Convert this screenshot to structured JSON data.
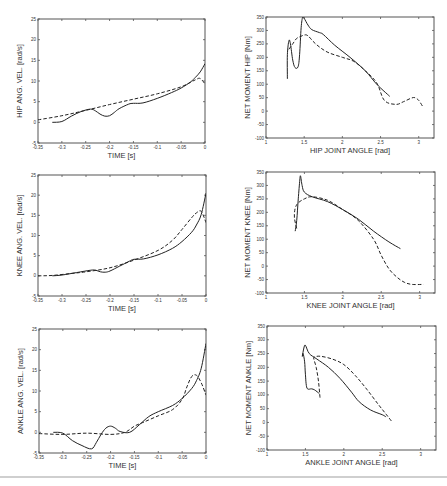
{
  "figure": {
    "colors": {
      "line": "#222222",
      "frame": "#555555",
      "text": "#333333"
    }
  },
  "chart_data": [
    {
      "id": "hip-vel",
      "type": "line",
      "title": "",
      "xlabel": "TIME  [s]",
      "ylabel": "HIP ANG. VEL.  [rad/s]",
      "xlim": [
        -0.35,
        0
      ],
      "ylim": [
        -5,
        25
      ],
      "xticks": [
        -0.35,
        -0.3,
        -0.25,
        -0.2,
        -0.15,
        -0.1,
        -0.05,
        0
      ],
      "xticklabels": [
        "-0.35",
        "-0.3",
        "-0.25",
        "-0.2",
        "-0.15",
        "-0.1",
        "-0.05",
        "0"
      ],
      "yticks": [
        -5,
        0,
        5,
        10,
        15,
        20,
        25
      ],
      "yticklabels": [
        "-5",
        "0",
        "5",
        "10",
        "15",
        "20",
        "25"
      ],
      "frame": {
        "x": 38,
        "y": 19,
        "w": 167,
        "h": 124
      },
      "series": [
        {
          "name": "measured",
          "style": "solid",
          "x": [
            -0.32,
            -0.3,
            -0.28,
            -0.26,
            -0.24,
            -0.23,
            -0.22,
            -0.21,
            -0.2,
            -0.19,
            -0.18,
            -0.16,
            -0.15,
            -0.13,
            -0.1,
            -0.07,
            -0.05,
            -0.03,
            -0.02,
            -0.01,
            0
          ],
          "y": [
            0,
            0.2,
            1.5,
            2.6,
            3.2,
            2.8,
            2.0,
            1.5,
            1.6,
            2.4,
            3.3,
            4.4,
            4.6,
            4.7,
            5.8,
            7.2,
            8.3,
            9.8,
            10.9,
            12.2,
            14.2
          ]
        },
        {
          "name": "model",
          "style": "dashed",
          "x": [
            -0.35,
            -0.3,
            -0.25,
            -0.2,
            -0.15,
            -0.1,
            -0.05,
            -0.02,
            -0.01,
            0
          ],
          "y": [
            0.6,
            1.6,
            2.9,
            4.3,
            5.6,
            6.9,
            8.6,
            10.3,
            10.6,
            9.3
          ]
        }
      ]
    },
    {
      "id": "hip-moment",
      "type": "line",
      "title": "",
      "xlabel": "HIP JOINT ANGLE  [rad]",
      "ylabel": "NET MOMENT HIP  [Nm]",
      "xlim": [
        1,
        3.2
      ],
      "ylim": [
        -100,
        350
      ],
      "xticks": [
        1,
        1.5,
        2,
        2.5,
        3
      ],
      "xticklabels": [
        "1",
        "1.5",
        "2",
        "2.5",
        "3"
      ],
      "yticks": [
        -100,
        -50,
        0,
        50,
        100,
        150,
        200,
        250,
        300,
        350
      ],
      "yticklabels": [
        "-100",
        "-50",
        "0",
        "50",
        "100",
        "150",
        "200",
        "250",
        "300",
        "350"
      ],
      "frame": {
        "x": 266,
        "y": 17,
        "w": 168,
        "h": 121
      },
      "series": [
        {
          "name": "measured",
          "style": "solid",
          "x": [
            1.28,
            1.28,
            1.3,
            1.32,
            1.35,
            1.38,
            1.42,
            1.44,
            1.46,
            1.48,
            1.5,
            1.55,
            1.6,
            1.7,
            1.75,
            1.9,
            2.1,
            2.3,
            2.45,
            2.62
          ],
          "y": [
            120,
            210,
            262,
            250,
            190,
            162,
            165,
            210,
            310,
            350,
            345,
            320,
            303,
            292,
            285,
            245,
            200,
            150,
            100,
            55
          ]
        },
        {
          "name": "model",
          "style": "dashed",
          "x": [
            1.3,
            1.35,
            1.4,
            1.45,
            1.5,
            1.55,
            1.65,
            1.8,
            2.0,
            2.15,
            2.3,
            2.45,
            2.55,
            2.7,
            2.8,
            2.9,
            2.95,
            3.0,
            3.05
          ],
          "y": [
            230,
            250,
            270,
            277,
            283,
            280,
            250,
            220,
            200,
            185,
            150,
            105,
            40,
            25,
            35,
            48,
            50,
            40,
            18
          ]
        }
      ]
    },
    {
      "id": "knee-vel",
      "type": "line",
      "title": "",
      "xlabel": "TIME  [s]",
      "ylabel": "KNEE ANG. VEL.  [rad/s]",
      "xlim": [
        -0.35,
        0
      ],
      "ylim": [
        -5,
        25
      ],
      "xticks": [
        -0.35,
        -0.3,
        -0.25,
        -0.2,
        -0.15,
        -0.1,
        -0.05,
        0
      ],
      "xticklabels": [
        "-0.35",
        "-0.3",
        "-0.25",
        "-0.2",
        "-0.15",
        "-0.1",
        "-0.05",
        "0"
      ],
      "yticks": [
        -5,
        0,
        5,
        10,
        15,
        20,
        25
      ],
      "yticklabels": [
        "-5",
        "0",
        "5",
        "10",
        "15",
        "20",
        "25"
      ],
      "frame": {
        "x": 38,
        "y": 175,
        "w": 168,
        "h": 121
      },
      "series": [
        {
          "name": "measured",
          "style": "solid",
          "x": [
            -0.32,
            -0.3,
            -0.27,
            -0.24,
            -0.23,
            -0.22,
            -0.21,
            -0.2,
            -0.18,
            -0.16,
            -0.15,
            -0.13,
            -0.1,
            -0.07,
            -0.05,
            -0.03,
            -0.02,
            -0.01,
            0
          ],
          "y": [
            0,
            0.2,
            0.8,
            1.4,
            1.4,
            1.0,
            0.9,
            1.2,
            2.4,
            3.6,
            4.1,
            4.2,
            5.2,
            6.8,
            8.5,
            10.8,
            12.6,
            15.2,
            20.5
          ]
        },
        {
          "name": "model",
          "style": "dashed",
          "x": [
            -0.35,
            -0.32,
            -0.28,
            -0.25,
            -0.2,
            -0.15,
            -0.1,
            -0.07,
            -0.05,
            -0.03,
            -0.02,
            -0.01,
            0
          ],
          "y": [
            0,
            0.1,
            0.6,
            1.0,
            2.0,
            3.9,
            6.3,
            8.8,
            11.5,
            14.4,
            15.6,
            16.0,
            13.2
          ]
        }
      ]
    },
    {
      "id": "knee-moment",
      "type": "line",
      "title": "",
      "xlabel": "KNEE JOINT ANGLE  [rad]",
      "ylabel": "NET MOMENT KNEE  [Nm]",
      "xlim": [
        1,
        3.2
      ],
      "ylim": [
        -100,
        350
      ],
      "xticks": [
        1,
        1.5,
        2,
        2.5,
        3
      ],
      "xticklabels": [
        "1",
        "1.5",
        "2",
        "2.5",
        "3"
      ],
      "yticks": [
        -100,
        -50,
        0,
        50,
        100,
        150,
        200,
        250,
        300,
        350
      ],
      "yticklabels": [
        "-100",
        "-50",
        "0",
        "50",
        "100",
        "150",
        "200",
        "250",
        "300",
        "350"
      ],
      "frame": {
        "x": 266,
        "y": 172,
        "w": 169,
        "h": 121
      },
      "series": [
        {
          "name": "measured",
          "style": "solid",
          "x": [
            1.38,
            1.4,
            1.42,
            1.44,
            1.45,
            1.47,
            1.5,
            1.6,
            1.8,
            2.0,
            2.2,
            2.4,
            2.6,
            2.75
          ],
          "y": [
            130,
            170,
            250,
            320,
            335,
            300,
            275,
            258,
            240,
            210,
            175,
            130,
            90,
            65
          ]
        },
        {
          "name": "model",
          "style": "dashed",
          "x": [
            1.4,
            1.37,
            1.38,
            1.42,
            1.5,
            1.6,
            1.8,
            2.0,
            2.2,
            2.4,
            2.5,
            2.6,
            2.7,
            2.8,
            2.9,
            3.05
          ],
          "y": [
            140,
            180,
            215,
            235,
            250,
            258,
            245,
            210,
            170,
            100,
            40,
            -10,
            -40,
            -60,
            -68,
            -68
          ]
        }
      ]
    },
    {
      "id": "ankle-vel",
      "type": "line",
      "title": "",
      "xlabel": "TIME  [s]",
      "ylabel": "ANKLE ANG. VEL.  [rad/s]",
      "xlim": [
        -0.35,
        0
      ],
      "ylim": [
        -5,
        25
      ],
      "xticks": [
        -0.35,
        -0.3,
        -0.25,
        -0.2,
        -0.15,
        -0.1,
        -0.05,
        0
      ],
      "xticklabels": [
        "-0.35",
        "-0.3",
        "-0.25",
        "-0.2",
        "-0.15",
        "-0.1",
        "-0.05",
        "0"
      ],
      "yticks": [
        -5,
        0,
        5,
        10,
        15,
        20,
        25
      ],
      "yticklabels": [
        "-5",
        "0",
        "5",
        "10",
        "15",
        "20",
        "25"
      ],
      "frame": {
        "x": 39,
        "y": 329,
        "w": 167,
        "h": 124
      },
      "series": [
        {
          "name": "measured",
          "style": "solid",
          "x": [
            -0.32,
            -0.3,
            -0.28,
            -0.26,
            -0.24,
            -0.23,
            -0.22,
            -0.21,
            -0.2,
            -0.19,
            -0.18,
            -0.16,
            -0.14,
            -0.12,
            -0.1,
            -0.07,
            -0.05,
            -0.03,
            -0.02,
            -0.01,
            0
          ],
          "y": [
            0,
            -0.2,
            -2.0,
            -3.2,
            -4.0,
            -2.5,
            -0.5,
            1.0,
            1.5,
            1.0,
            0.2,
            0,
            1.8,
            3.8,
            5.0,
            6.5,
            8.2,
            10.6,
            12.5,
            15.5,
            21.5
          ]
        },
        {
          "name": "model",
          "style": "dashed",
          "x": [
            -0.35,
            -0.3,
            -0.25,
            -0.2,
            -0.17,
            -0.15,
            -0.13,
            -0.1,
            -0.07,
            -0.05,
            -0.04,
            -0.03,
            -0.02,
            -0.01,
            0
          ],
          "y": [
            -0.3,
            -0.5,
            -0.2,
            -0.5,
            0,
            1.5,
            2.5,
            4.0,
            5.5,
            8.0,
            11.0,
            13.5,
            13.8,
            12.0,
            9.0
          ]
        }
      ]
    },
    {
      "id": "ankle-moment",
      "type": "line",
      "title": "",
      "xlabel": "ANKLE JOINT ANGLE  [rad]",
      "ylabel": "NET MOMENT ANKLE  [Nm]",
      "xlim": [
        1,
        3.2
      ],
      "ylim": [
        -100,
        350
      ],
      "xticks": [
        1,
        1.5,
        2,
        2.5,
        3
      ],
      "xticklabels": [
        "1",
        "1.5",
        "2",
        "2.5",
        "3"
      ],
      "yticks": [
        -100,
        -50,
        0,
        50,
        100,
        150,
        200,
        250,
        300,
        350
      ],
      "yticklabels": [
        "-100",
        "-50",
        "0",
        "50",
        "100",
        "150",
        "200",
        "250",
        "300",
        "350"
      ],
      "frame": {
        "x": 267,
        "y": 326,
        "w": 169,
        "h": 124
      },
      "series": [
        {
          "name": "measured",
          "style": "solid",
          "x": [
            1.68,
            1.62,
            1.58,
            1.52,
            1.5,
            1.49,
            1.47,
            1.46,
            1.48,
            1.5,
            1.55,
            1.65,
            1.8,
            1.95,
            2.1,
            2.2,
            2.35,
            2.5,
            2.55
          ],
          "y": [
            105,
            118,
            122,
            125,
            175,
            220,
            250,
            240,
            270,
            280,
            250,
            230,
            200,
            160,
            110,
            75,
            45,
            28,
            20
          ]
        },
        {
          "name": "model",
          "style": "dashed",
          "x": [
            1.69,
            1.67,
            1.64,
            1.61,
            1.62,
            1.7,
            1.85,
            2.0,
            2.15,
            2.3,
            2.45,
            2.55,
            2.62
          ],
          "y": [
            90,
            150,
            200,
            230,
            238,
            240,
            230,
            210,
            170,
            120,
            65,
            30,
            5
          ]
        }
      ]
    }
  ]
}
